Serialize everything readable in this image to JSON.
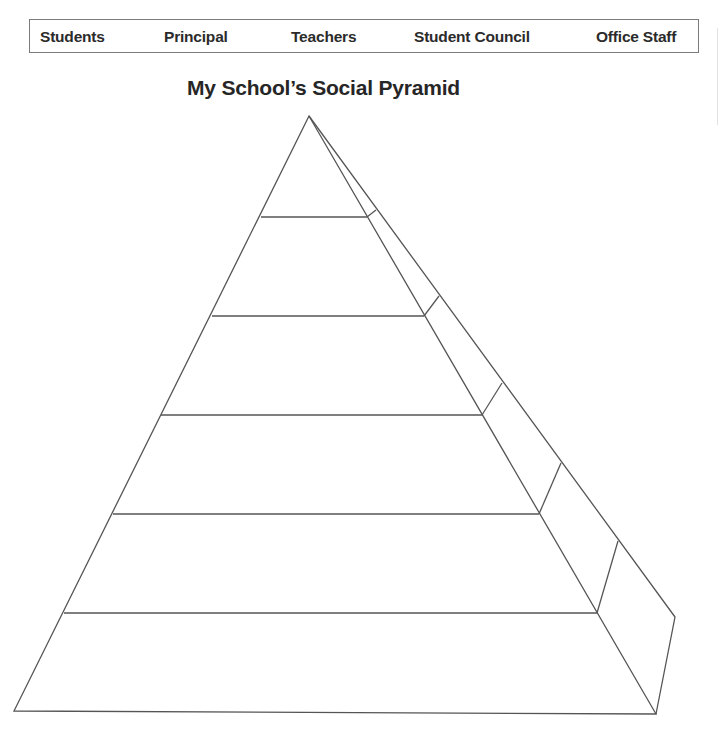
{
  "word_bank": {
    "items": [
      {
        "label": "Students",
        "x": 10
      },
      {
        "label": "Principal",
        "x": 134
      },
      {
        "label": "Teachers",
        "x": 261
      },
      {
        "label": "Student Council",
        "x": 384
      },
      {
        "label": "Office Staff",
        "x": 566
      }
    ]
  },
  "title": "My School’s Social Pyramid",
  "pyramid": {
    "levels": 6,
    "apex": [
      309,
      116
    ],
    "front_base": {
      "left": [
        14,
        711
      ],
      "right": [
        656,
        714
      ]
    },
    "back_right_corner": [
      675,
      617
    ],
    "tier_lines": [
      {
        "y": 217,
        "x1": 261,
        "x2": 367,
        "side_top": [
          376,
          210
        ]
      },
      {
        "y": 316,
        "x1": 212,
        "x2": 424,
        "side_top": [
          439,
          296
        ]
      },
      {
        "y": 415,
        "x1": 161,
        "x2": 482,
        "side_top": [
          502,
          383
        ]
      },
      {
        "y": 514,
        "x1": 113,
        "x2": 539,
        "side_top": [
          561,
          463
        ]
      },
      {
        "y": 613,
        "x1": 64,
        "x2": 597,
        "side_top": [
          618,
          541
        ]
      }
    ]
  }
}
